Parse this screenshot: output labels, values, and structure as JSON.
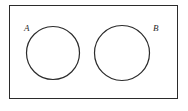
{
  "figure": {
    "type": "venn-diagram",
    "background_color": "#ffffff",
    "stroke_color": "#2b2b2b",
    "label_color": "#2b2b2b",
    "universe": {
      "name": "universal-set-rectangle",
      "x": 9.5,
      "y": 5.5,
      "width": 168,
      "height": 93,
      "stroke_width": 1
    },
    "sets": [
      {
        "id": "A",
        "label": "A",
        "cx": 53,
        "cy": 53,
        "r": 26.5,
        "stroke_width": 1.2,
        "label_x": 24,
        "label_y": 31
      },
      {
        "id": "B",
        "label": "B",
        "cx": 122,
        "cy": 53,
        "r": 27.5,
        "stroke_width": 1.2,
        "label_x": 153,
        "label_y": 31
      }
    ]
  }
}
